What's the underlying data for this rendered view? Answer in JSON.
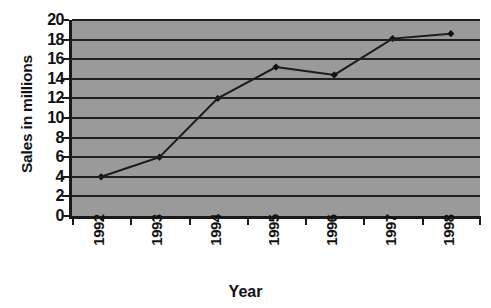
{
  "chart_data": {
    "type": "line",
    "title": "",
    "xlabel": "Year",
    "ylabel": "Sales in millions",
    "categories": [
      "1992",
      "1993",
      "1994",
      "1995",
      "1996",
      "1997",
      "1998"
    ],
    "values": [
      4,
      6,
      12,
      15.2,
      14.4,
      18.1,
      18.6
    ],
    "series": [
      {
        "name": "Sales",
        "values": [
          4,
          6,
          12,
          15.2,
          14.4,
          18.1,
          18.6
        ]
      }
    ],
    "ylim": [
      0,
      20
    ],
    "yticks": [
      0,
      2,
      4,
      6,
      8,
      10,
      12,
      14,
      16,
      18,
      20
    ],
    "ytick_labels": [
      "0",
      "2",
      "4",
      "6",
      "8",
      "10",
      "12",
      "14",
      "16",
      "18",
      "20"
    ],
    "xtick_labels": [
      "1992",
      "1993",
      "1994",
      "1995",
      "1996",
      "1997",
      "1998"
    ],
    "grid": "horizontal",
    "legend": "none",
    "xtick_rotation": 90,
    "marker": "diamond",
    "colors": {
      "plot_background": "#9a9a9a",
      "gridline": "#1f1f1f",
      "axis": "#1a1a1a",
      "series_line": "#1a1a1a",
      "marker_fill": "#111111",
      "text": "#111111",
      "page_background": "#ffffff"
    },
    "annotations": []
  },
  "title_remnant": {
    "text": "= = ="
  }
}
